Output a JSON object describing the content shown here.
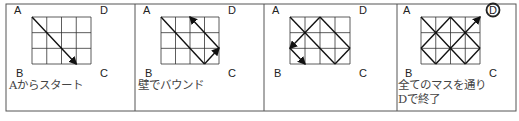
{
  "figure": {
    "border_color": "#555555",
    "grid_color": "#333333",
    "path_color": "#111111",
    "label_color": "#222222",
    "caption_color": "#444444",
    "outer_box": {
      "x": 6,
      "y": 4,
      "w": 510,
      "h": 107
    },
    "grid": {
      "cols": 4,
      "rows": 3
    }
  },
  "panels": [
    {
      "id": "start",
      "x0": 6,
      "x1": 135,
      "grid": {
        "x": 32,
        "y": 17,
        "w": 59,
        "h": 47
      },
      "corners": {
        "A": "A",
        "B": "B",
        "C": "C",
        "D": "D"
      },
      "circled_corner": null,
      "path": [
        [
          0,
          0
        ],
        [
          3,
          3
        ]
      ],
      "arrows_at": [
        1
      ],
      "caption": [
        "Aからスタート"
      ]
    },
    {
      "id": "bounce",
      "x0": 135,
      "x1": 264,
      "grid": {
        "x": 161,
        "y": 17,
        "w": 58,
        "h": 47
      },
      "corners": {
        "A": "A",
        "B": "B",
        "C": "C",
        "D": "D"
      },
      "circled_corner": null,
      "path": [
        [
          0,
          0
        ],
        [
          3,
          3
        ],
        [
          4,
          2
        ],
        [
          2,
          0
        ]
      ],
      "arrows_at": [
        2,
        3
      ],
      "caption": [
        "壁でバウンド"
      ]
    },
    {
      "id": "continue",
      "x0": 264,
      "x1": 397,
      "grid": {
        "x": 290,
        "y": 17,
        "w": 60,
        "h": 47
      },
      "corners": {
        "A": "A",
        "B": "B",
        "C": "C",
        "D": "D"
      },
      "circled_corner": null,
      "path": [
        [
          0,
          0
        ],
        [
          3,
          3
        ],
        [
          4,
          2
        ],
        [
          2,
          0
        ],
        [
          0,
          2
        ],
        [
          1,
          3
        ]
      ],
      "arrows_at": [
        4,
        5
      ],
      "caption": []
    },
    {
      "id": "finish",
      "x0": 397,
      "x1": 516,
      "grid": {
        "x": 421,
        "y": 17,
        "w": 59,
        "h": 47
      },
      "corners": {
        "A": "A",
        "B": "B",
        "C": "C",
        "D": "D"
      },
      "circled_corner": "D",
      "path": [
        [
          0,
          0
        ],
        [
          3,
          3
        ],
        [
          4,
          2
        ],
        [
          2,
          0
        ],
        [
          0,
          2
        ],
        [
          1,
          3
        ],
        [
          4,
          0
        ]
      ],
      "arrows_at": [
        6
      ],
      "caption": [
        "全てのマスを通り",
        "Dで終了"
      ]
    }
  ]
}
